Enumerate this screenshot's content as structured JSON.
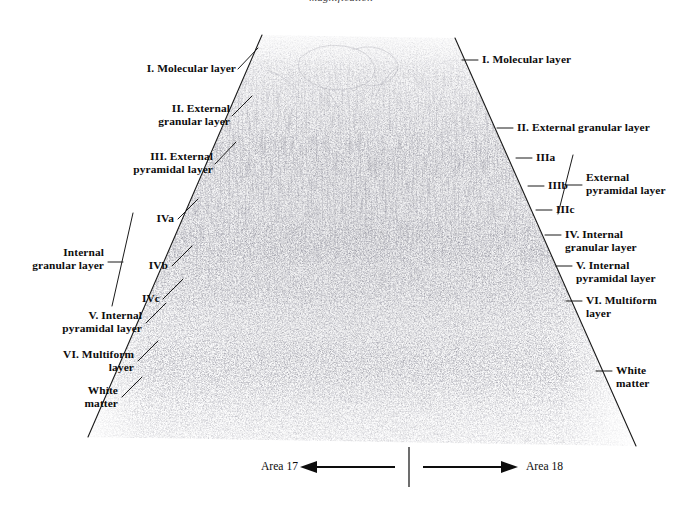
{
  "figure": {
    "title": "magnification",
    "alt_name": "cytoarchitecture-of-visual-cortex"
  },
  "left_labels": [
    {
      "id": "molecular",
      "text": "I. Molecular layer"
    },
    {
      "id": "external-granular",
      "text": "II. External\ngranular layer"
    },
    {
      "id": "external-pyramidal",
      "text": "III. External\npyramidal layer"
    },
    {
      "id": "iva",
      "text": "IVa"
    },
    {
      "id": "internal-granular",
      "text": "Internal\ngranular layer"
    },
    {
      "id": "ivb",
      "text": "IVb"
    },
    {
      "id": "ivc",
      "text": "IVc"
    },
    {
      "id": "internal-pyramidal",
      "text": "V. Internal\npyramidal layer"
    },
    {
      "id": "multiform",
      "text": "VI. Multiform\nlayer"
    },
    {
      "id": "white-matter",
      "text": "White\nmatter"
    }
  ],
  "right_labels": [
    {
      "id": "molecular",
      "text": "I. Molecular layer"
    },
    {
      "id": "external-granular",
      "text": "II. External granular layer"
    },
    {
      "id": "iiia",
      "text": "IIIa"
    },
    {
      "id": "iiib",
      "text": "IIIb"
    },
    {
      "id": "iiic",
      "text": "IIIc"
    },
    {
      "id": "external-pyramidal",
      "text": "External\npyramidal layer"
    },
    {
      "id": "internal-granular",
      "text": "IV. Internal\ngranular layer"
    },
    {
      "id": "internal-pyramidal",
      "text": "V. Internal\npyramidal layer"
    },
    {
      "id": "multiform",
      "text": "VI. Multiform\nlayer"
    },
    {
      "id": "white-matter",
      "text": "White\nmatter"
    }
  ],
  "caption": {
    "left_area": "Area 17",
    "right_area": "Area 18",
    "left_arrow": "left-arrow-icon",
    "right_arrow": "right-arrow-icon",
    "divider": "vertical-divider"
  },
  "colors": {
    "ink": "#0d0d0d",
    "background": "#ffffff",
    "leader_line": "#1a1a1a",
    "stain": "#4a4a55"
  },
  "micrograph": {
    "shape": "trapezoid",
    "top_left": [
      262,
      35
    ],
    "top_right": [
      455,
      38
    ],
    "bottom_left": [
      88,
      437
    ],
    "bottom_right": [
      636,
      446
    ],
    "description": "Nissl-stained coronal section of human visual cortex spanning the area 17 / area 18 border"
  }
}
